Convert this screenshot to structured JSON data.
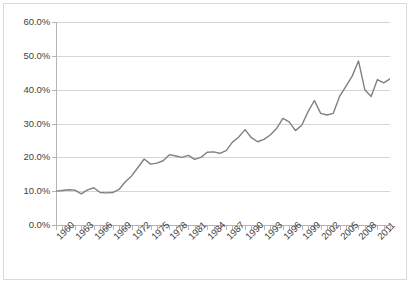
{
  "chart_data": {
    "type": "line",
    "title": "",
    "subtitle": "",
    "xlabel": "",
    "ylabel": "",
    "ylim": [
      0,
      60
    ],
    "xlim": [
      1960,
      2013
    ],
    "grid": true,
    "legend": false,
    "legend_position": "none",
    "line_color": "#808080",
    "gridline_color": "#D6D6D6",
    "axis_color": "#B5B5B5",
    "y_tick_labels": [
      "60.0%",
      "50.0%",
      "40.0%",
      "30.0%",
      "20.0%",
      "10.0%",
      "0.0%"
    ],
    "y_tick_values": [
      60,
      50,
      40,
      30,
      20,
      10,
      0
    ],
    "x_tick_labels": [
      "1960",
      "1963",
      "1966",
      "1969",
      "1972",
      "1975",
      "1978",
      "1981",
      "1984",
      "1987",
      "1990",
      "1993",
      "1996",
      "1999",
      "2002",
      "2005",
      "2008",
      "2011"
    ],
    "x_tick_values": [
      1960,
      1963,
      1966,
      1969,
      1972,
      1975,
      1978,
      1981,
      1984,
      1987,
      1990,
      1993,
      1996,
      1999,
      2002,
      2005,
      2008,
      2011
    ],
    "x": [
      1960,
      1961,
      1962,
      1963,
      1964,
      1965,
      1966,
      1967,
      1968,
      1969,
      1970,
      1971,
      1972,
      1973,
      1974,
      1975,
      1976,
      1977,
      1978,
      1979,
      1980,
      1981,
      1982,
      1983,
      1984,
      1985,
      1986,
      1987,
      1988,
      1989,
      1990,
      1991,
      1992,
      1993,
      1994,
      1995,
      1996,
      1997,
      1998,
      1999,
      2000,
      2001,
      2002,
      2003,
      2004,
      2005,
      2006,
      2007,
      2008,
      2009,
      2010,
      2011,
      2012,
      2013
    ],
    "series": [
      {
        "name": "Trade (% of GDP)",
        "values": [
          10.0,
          10.2,
          10.4,
          10.3,
          9.2,
          10.4,
          11.0,
          9.6,
          9.5,
          9.6,
          10.5,
          12.8,
          14.5,
          17.0,
          19.5,
          18.0,
          18.3,
          19.0,
          20.8,
          20.4,
          20.0,
          20.6,
          19.4,
          20.0,
          21.5,
          21.6,
          21.2,
          22.0,
          24.5,
          26.0,
          28.2,
          25.8,
          24.6,
          25.3,
          26.6,
          28.5,
          31.5,
          30.5,
          27.9,
          29.5,
          33.5,
          36.8,
          33.0,
          32.5,
          33.0,
          38.0,
          41.0,
          44.0,
          48.5,
          40.0,
          38.0,
          43.0,
          42.0,
          43.2
        ]
      }
    ]
  }
}
